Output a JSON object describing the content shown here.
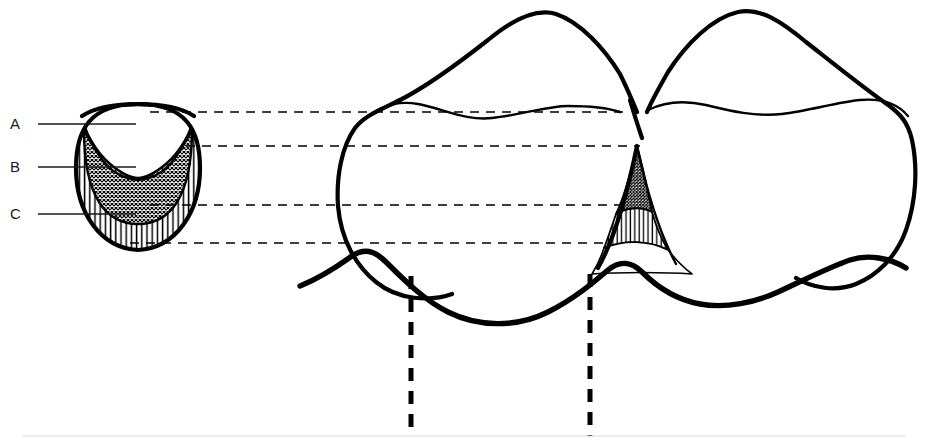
{
  "figure": {
    "background_color": "#ffffff",
    "ink_color": "#000000",
    "label_color": "#1a1a1a",
    "width": 933,
    "height": 444
  },
  "labels": [
    {
      "id": "A",
      "text": "A",
      "zone_name": "col-concavity",
      "fill_pattern": "blank",
      "x": 10,
      "y": 129,
      "leader_x1": 38,
      "leader_x2": 136,
      "leader_y": 124
    },
    {
      "id": "B",
      "text": "B",
      "zone_name": "crosshatch-zone",
      "fill_pattern": "crosshatch",
      "x": 10,
      "y": 172,
      "leader_x1": 38,
      "leader_x2": 136,
      "leader_y": 167
    },
    {
      "id": "C",
      "text": "C",
      "zone_name": "vertical-hatch-zone",
      "fill_pattern": "vertical-lines",
      "x": 10,
      "y": 219,
      "leader_x1": 38,
      "leader_x2": 136,
      "leader_y": 214
    }
  ],
  "connector_lines": [
    {
      "id": "connector-1",
      "y": 112,
      "x1": 150,
      "x2": 628,
      "level_name": "cemento-enamel-junction-level"
    },
    {
      "id": "connector-2",
      "y": 146,
      "x1": 186,
      "x2": 640,
      "level_name": "papilla-tip-level"
    },
    {
      "id": "connector-3",
      "y": 205,
      "x1": 150,
      "x2": 632,
      "level_name": "col-base-level"
    },
    {
      "id": "connector-4",
      "y": 243,
      "x1": 130,
      "x2": 614,
      "level_name": "gingival-margin-level"
    }
  ],
  "vertical_dashed_lines": [
    {
      "id": "contact-axis-left",
      "x": 411,
      "y1": 276,
      "y2": 436
    },
    {
      "id": "contact-axis-right",
      "x": 590,
      "y1": 274,
      "y2": 436
    }
  ],
  "cross_section": {
    "name": "papilla-cross-section",
    "center_x": 138,
    "top_y": 106,
    "bottom_y": 248,
    "zones": [
      "A",
      "B",
      "C"
    ]
  },
  "tooth_view": {
    "name": "two-molar-clinical-view",
    "left_tooth_label": "left-molar",
    "right_tooth_label": "right-molar",
    "papilla_label": "interdental-papilla",
    "gingival_margin_label": "gingival-margin"
  }
}
